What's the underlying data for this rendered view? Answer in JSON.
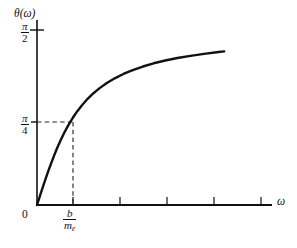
{
  "figure": {
    "name": "phase-angle-vs-frequency-plot",
    "axis_color": "#111111",
    "curve_color": "#111111",
    "dash_color": "#333333",
    "background": "#ffffff"
  },
  "labels": {
    "y_axis_title": "θ(ω)",
    "y_axis_title_fn": "θ",
    "y_axis_title_arg": "(ω)",
    "x_axis_title": "ω",
    "origin": "0",
    "y_tick_top_num": "π",
    "y_tick_top_den": "2",
    "y_tick_mid_num": "π",
    "y_tick_mid_den": "4",
    "x_tick_num": "b",
    "x_tick_den_base": "m",
    "x_tick_den_sub": "e"
  },
  "chart_data": {
    "type": "line",
    "title": "",
    "xlabel": "ω",
    "ylabel": "θ(ω)",
    "xlim": [
      0,
      5.5
    ],
    "ylim": [
      0,
      1.6708
    ],
    "grid": false,
    "legend": null,
    "x_tick_labels": [
      "0",
      "b/m_e"
    ],
    "x_tick_values": [
      0,
      1
    ],
    "y_tick_labels": [
      "π/4",
      "π/2"
    ],
    "y_tick_values": [
      0.7854,
      1.5708
    ],
    "x_minor_tick_values": [
      1,
      2,
      3,
      4,
      5
    ],
    "annotations": [
      {
        "type": "dashed-horizontal",
        "y": 0.7854,
        "from_x": 0,
        "to_x": 1
      },
      {
        "type": "dashed-vertical",
        "x": 1,
        "from_y": 0,
        "to_y": 0.7854
      }
    ],
    "function": "theta(omega) = arctan(omega * m_e / b)",
    "series": [
      {
        "name": "θ(ω)",
        "x": [
          0.0,
          0.06,
          0.12,
          0.18,
          0.25,
          0.32,
          0.4,
          0.48,
          0.56,
          0.65,
          0.74,
          0.83,
          0.92,
          1.0,
          1.12,
          1.25,
          1.4,
          1.56,
          1.74,
          1.94,
          2.16,
          2.4,
          2.66,
          2.94,
          3.24,
          3.56,
          3.9,
          4.26,
          4.64,
          5.04,
          5.2
        ],
        "y": [
          0.0,
          0.06,
          0.119,
          0.178,
          0.245,
          0.31,
          0.381,
          0.448,
          0.511,
          0.576,
          0.637,
          0.693,
          0.744,
          0.785,
          0.842,
          0.896,
          0.951,
          1.001,
          1.049,
          1.095,
          1.137,
          1.176,
          1.211,
          1.243,
          1.272,
          1.297,
          1.319,
          1.339,
          1.357,
          1.373,
          1.379
        ]
      }
    ]
  },
  "geometry": {
    "origin_px": [
      37,
      205
    ],
    "x_axis_end_px": [
      272,
      205
    ],
    "y_axis_top_px": [
      37,
      20
    ],
    "pi_over_2_px_y": 30,
    "pi_over_4_px_y": 122,
    "b_over_me_px_x": 73,
    "x_minor_ticks_px": [
      73,
      120,
      167,
      214,
      261
    ],
    "curve_end_px": [
      262,
      58
    ]
  }
}
